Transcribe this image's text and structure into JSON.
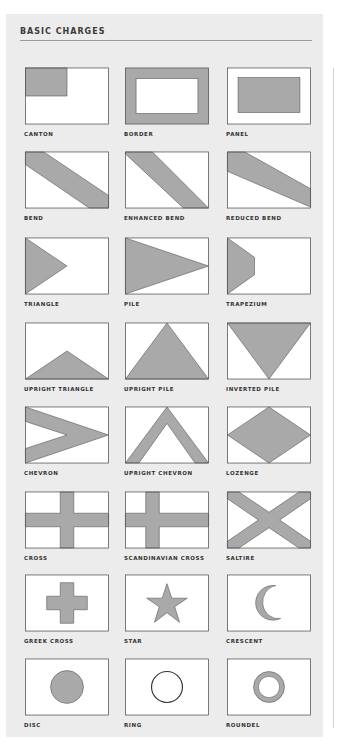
{
  "title": "BASIC CHARGES",
  "colors": {
    "panel": "#ececec",
    "field": "#ffffff",
    "charge": "#a9a9a9",
    "outline": "#555555"
  },
  "charges": [
    {
      "id": "canton",
      "label": "CANTON"
    },
    {
      "id": "border",
      "label": "BORDER"
    },
    {
      "id": "panel",
      "label": "PANEL"
    },
    {
      "id": "bend",
      "label": "BEND"
    },
    {
      "id": "enhanced-bend",
      "label": "ENHANCED BEND"
    },
    {
      "id": "reduced-bend",
      "label": "REDUCED BEND"
    },
    {
      "id": "triangle",
      "label": "TRIANGLE"
    },
    {
      "id": "pile",
      "label": "PILE"
    },
    {
      "id": "trapezium",
      "label": "TRAPEZIUM"
    },
    {
      "id": "upright-triangle",
      "label": "UPRIGHT TRIANGLE"
    },
    {
      "id": "upright-pile",
      "label": "UPRIGHT PILE"
    },
    {
      "id": "inverted-pile",
      "label": "INVERTED PILE"
    },
    {
      "id": "chevron",
      "label": "CHEVRON"
    },
    {
      "id": "upright-chevron",
      "label": "UPRIGHT CHEVRON"
    },
    {
      "id": "lozenge",
      "label": "LOZENGE"
    },
    {
      "id": "cross",
      "label": "CROSS"
    },
    {
      "id": "scandinavian-cross",
      "label": "SCANDINAVIAN CROSS"
    },
    {
      "id": "saltire",
      "label": "SALTIRE"
    },
    {
      "id": "greek-cross",
      "label": "GREEK CROSS"
    },
    {
      "id": "star",
      "label": "STAR"
    },
    {
      "id": "crescent",
      "label": "CRESCENT"
    },
    {
      "id": "disc",
      "label": "DISC"
    },
    {
      "id": "ring",
      "label": "RING"
    },
    {
      "id": "roundel",
      "label": "ROUNDEL"
    }
  ]
}
